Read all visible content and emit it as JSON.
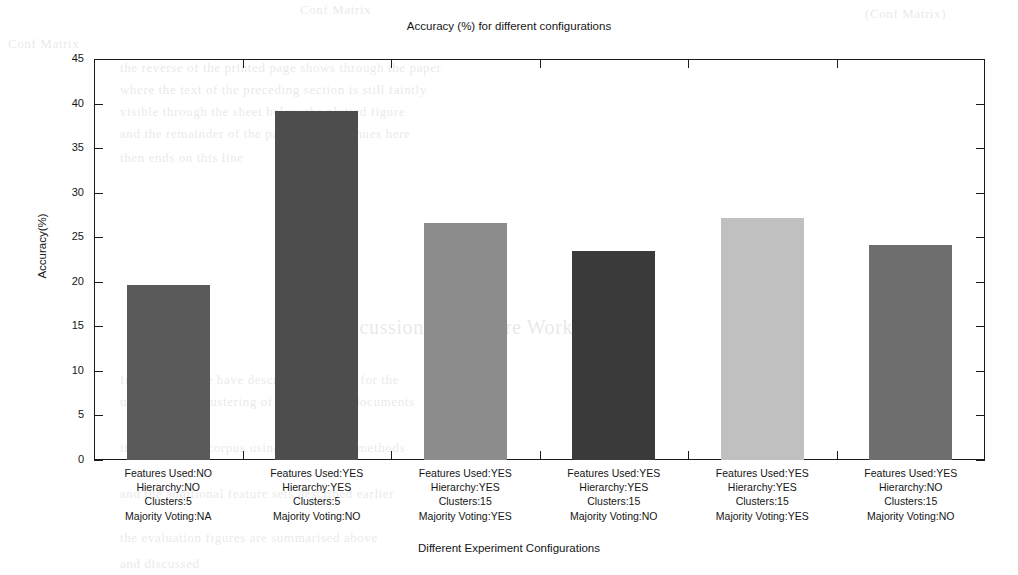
{
  "chart_data": {
    "type": "bar",
    "title": "Accuracy (%) for different configurations",
    "xlabel": "Different Experiment Configurations",
    "ylabel": "Accuracy(%)",
    "ylim": [
      0,
      45
    ],
    "ytick_values": [
      0,
      5,
      10,
      15,
      20,
      25,
      30,
      35,
      40,
      45
    ],
    "ytick_labels": [
      "0",
      "5",
      "10",
      "15",
      "20",
      "25",
      "30",
      "35",
      "40",
      "45"
    ],
    "grid": false,
    "legend": "none",
    "categories": [
      "Features Used:NO\nHierarchy:NO\nClusters:5\nMajority Voting:NA",
      "Features Used:YES\nHierarchy:YES\nClusters:5\nMajority Voting:NO",
      "Features Used:YES\nHierarchy:YES\nClusters:15\nMajority Voting:YES",
      "Features Used:YES\nHierarchy:YES\nClusters:15\nMajority Voting:NO",
      "Features Used:YES\nHierarchy:YES\nClusters:15\nMajority Voting:YES",
      "Features Used:YES\nHierarchy:NO\nClusters:15\nMajority Voting:NO"
    ],
    "values": [
      19.6,
      39.2,
      26.6,
      23.4,
      27.2,
      24.1
    ],
    "bar_colors": [
      "#5a5a5a",
      "#4d4d4d",
      "#8c8c8c",
      "#3a3a3a",
      "#c0c0c0",
      "#6e6e6e"
    ]
  },
  "bars": [
    {
      "index": 1,
      "value": 19.6,
      "color": "#5a5a5a",
      "lines": [
        "Features Used:NO",
        "Hierarchy:NO",
        "Clusters:5",
        "Majority Voting:NA"
      ]
    },
    {
      "index": 2,
      "value": 39.2,
      "color": "#4d4d4d",
      "lines": [
        "Features Used:YES",
        "Hierarchy:YES",
        "Clusters:5",
        "Majority Voting:NO"
      ]
    },
    {
      "index": 3,
      "value": 26.6,
      "color": "#8c8c8c",
      "lines": [
        "Features Used:YES",
        "Hierarchy:YES",
        "Clusters:15",
        "Majority Voting:YES"
      ]
    },
    {
      "index": 4,
      "value": 23.4,
      "color": "#3a3a3a",
      "lines": [
        "Features Used:YES",
        "Hierarchy:YES",
        "Clusters:15",
        "Majority Voting:NO"
      ]
    },
    {
      "index": 5,
      "value": 27.2,
      "color": "#c0c0c0",
      "lines": [
        "Features Used:YES",
        "Hierarchy:YES",
        "Clusters:15",
        "Majority Voting:YES"
      ]
    },
    {
      "index": 6,
      "value": 24.1,
      "color": "#6e6e6e",
      "lines": [
        "Features Used:YES",
        "Hierarchy:NO",
        "Clusters:15",
        "Majority Voting:NO"
      ]
    }
  ],
  "scan_bleed": [
    {
      "text": "Conf Matrix",
      "x": 300,
      "y": 2,
      "size": 13
    },
    {
      "text": "(Conf Matrix)",
      "x": 865,
      "y": 6,
      "size": 13
    },
    {
      "text": "Conf Matrix",
      "x": 8,
      "y": 36,
      "size": 13
    },
    {
      "text": "the reverse of the printed page shows through the paper",
      "x": 120,
      "y": 60,
      "size": 13
    },
    {
      "text": "where the text of the preceding section is still faintly",
      "x": 120,
      "y": 82,
      "size": 13
    },
    {
      "text": "visible through the sheet below the plotted figure",
      "x": 120,
      "y": 104,
      "size": 13
    },
    {
      "text": "and the remainder of the paragraph continues here",
      "x": 120,
      "y": 126,
      "size": 13
    },
    {
      "text": "then ends on this line",
      "x": 120,
      "y": 150,
      "size": 13
    },
    {
      "text": "Discussion and Future Work",
      "x": 330,
      "y": 316,
      "size": 20
    },
    {
      "text": "In this paper we have described a system for the",
      "x": 120,
      "y": 372,
      "size": 13
    },
    {
      "text": "unsupervised clustering of topic related documents",
      "x": 120,
      "y": 394,
      "size": 13
    },
    {
      "text": "in a very large corpus using hierarchical methods",
      "x": 120,
      "y": 440,
      "size": 13
    },
    {
      "text": "and the additional feature sets described earlier",
      "x": 120,
      "y": 486,
      "size": 13
    },
    {
      "text": "the evaluation figures are summarised above",
      "x": 120,
      "y": 530,
      "size": 13
    },
    {
      "text": "and discussed",
      "x": 120,
      "y": 556,
      "size": 13
    }
  ]
}
